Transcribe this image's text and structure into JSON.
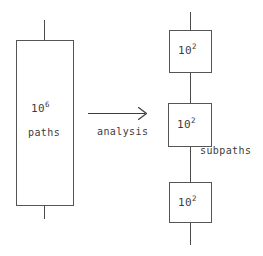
{
  "figure": {
    "background_color": "#ffffff",
    "stroke_color": "#555555",
    "text_color": "#3d3d3d"
  },
  "source_block": {
    "count_label": "10",
    "count_exponent": "6",
    "unit_label": "paths"
  },
  "transform": {
    "label": "analysis",
    "arrow_icon": "right-arrow-icon"
  },
  "result_blocks": [
    {
      "count_label": "10",
      "count_exponent": "2"
    },
    {
      "count_label": "10",
      "count_exponent": "2"
    },
    {
      "count_label": "10",
      "count_exponent": "2"
    }
  ],
  "result_annotation": {
    "label": "subpaths"
  }
}
